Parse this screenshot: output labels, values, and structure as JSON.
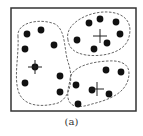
{
  "figure": {
    "caption": "(a)",
    "frame": {
      "x": 11,
      "y": 8,
      "width": 125,
      "height": 103,
      "stroke": "#333333"
    },
    "colors": {
      "point": "#111111",
      "boundary": "#555555",
      "centroid": "#222222"
    }
  },
  "clusters": [
    {
      "name": "left-cluster",
      "boundary_path": "M 18 37 C 16 22, 40 18, 55 24 C 66 30, 64 50, 68 62 C 74 78, 70 98, 58 103 C 40 108, 22 106, 18 90 C 14 75, 19 55, 18 37 Z",
      "centroid": {
        "x": 35,
        "y": 67
      },
      "points": [
        {
          "x": 27,
          "y": 34
        },
        {
          "x": 41,
          "y": 30
        },
        {
          "x": 25,
          "y": 49
        },
        {
          "x": 54,
          "y": 45
        },
        {
          "x": 35,
          "y": 67
        },
        {
          "x": 60,
          "y": 76
        },
        {
          "x": 25,
          "y": 83
        },
        {
          "x": 60,
          "y": 92
        }
      ]
    },
    {
      "name": "top-right-cluster",
      "boundary_path": "M 68 40 C 64 24, 88 11, 108 12 C 126 13, 134 24, 128 40 C 122 54, 100 57, 86 55 C 74 53, 69 48, 68 40 Z",
      "centroid": {
        "x": 100,
        "y": 36
      },
      "points": [
        {
          "x": 89,
          "y": 23
        },
        {
          "x": 100,
          "y": 19
        },
        {
          "x": 116,
          "y": 22
        },
        {
          "x": 120,
          "y": 34
        },
        {
          "x": 77,
          "y": 40
        },
        {
          "x": 107,
          "y": 43
        },
        {
          "x": 94,
          "y": 49
        }
      ]
    },
    {
      "name": "bottom-right-cluster",
      "boundary_path": "M 70 80 C 70 68, 88 62, 108 61 C 124 60, 132 66, 128 80 C 124 94, 108 100, 92 104 C 80 108, 70 108, 68 98 C 67 90, 69 86, 70 80 Z",
      "centroid": {
        "x": 97,
        "y": 89
      },
      "points": [
        {
          "x": 106,
          "y": 70
        },
        {
          "x": 121,
          "y": 72
        },
        {
          "x": 76,
          "y": 85
        },
        {
          "x": 92,
          "y": 90
        },
        {
          "x": 109,
          "y": 94
        },
        {
          "x": 78,
          "y": 104
        }
      ]
    }
  ]
}
